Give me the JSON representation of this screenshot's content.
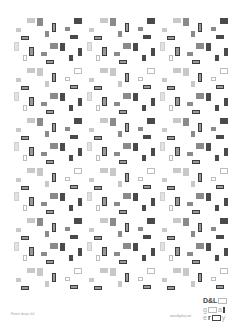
{
  "artwork": {
    "type": "rectangle-pattern",
    "colors": {
      "background": "#ffffff",
      "light": "#c8c8c8",
      "mid": "#8a8a8a",
      "dark": "#4a4a4a",
      "outline_dark": "#3c3c3c",
      "outline_light": "#bdbdbd"
    }
  },
  "footer": {
    "caption": "Pattern design 4x5",
    "url": "www.dlgallery.com"
  },
  "logo": {
    "line1": "D&L",
    "line2_start": "g",
    "line2_end": "a",
    "line3_start": "e",
    "line3_mid": "r",
    "line3_end": "y"
  }
}
